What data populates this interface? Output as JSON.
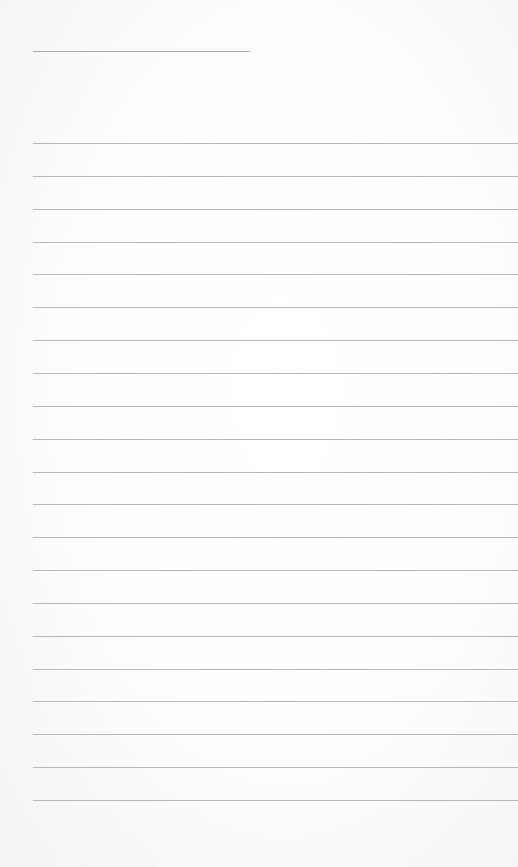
{
  "page": {
    "type": "lined-paper",
    "title": "",
    "background_color": "#fcfcfc",
    "line_color": "#b8b8b8",
    "title_line": {
      "x": 33,
      "y": 51,
      "width": 217
    },
    "rules": {
      "count": 21,
      "start_x": 33,
      "first_y": 143,
      "spacing": 32.85
    },
    "lines_text": [
      "",
      "",
      "",
      "",
      "",
      "",
      "",
      "",
      "",
      "",
      "",
      "",
      "",
      "",
      "",
      "",
      "",
      "",
      "",
      "",
      ""
    ]
  }
}
